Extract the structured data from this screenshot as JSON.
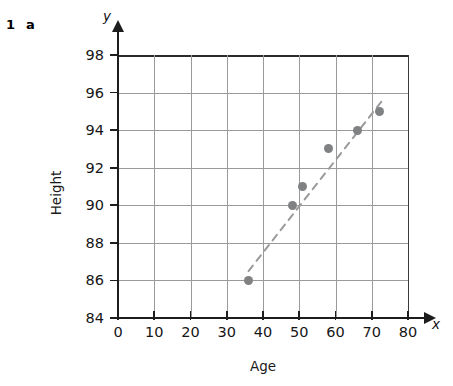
{
  "question": {
    "number": "1",
    "part": "a"
  },
  "chart_data": {
    "type": "scatter",
    "title": "",
    "xlabel": "Age",
    "ylabel": "Height",
    "x_axis_symbol": "x",
    "y_axis_symbol": "y",
    "xlim": [
      0,
      80
    ],
    "ylim": [
      84,
      98
    ],
    "xticks": [
      0,
      10,
      20,
      30,
      40,
      50,
      60,
      70,
      80
    ],
    "yticks": [
      84,
      86,
      88,
      90,
      92,
      94,
      96,
      98
    ],
    "xtick_labels": [
      "0",
      "10",
      "20",
      "30",
      "40",
      "50",
      "60",
      "70",
      "80"
    ],
    "ytick_labels": [
      "84",
      "86",
      "88",
      "90",
      "92",
      "94",
      "96",
      "98"
    ],
    "grid": true,
    "legend": null,
    "point_color": "#7f8183",
    "grid_color": "#9a9a9a",
    "axis_color": "#1d1d1d",
    "trendline_color": "#9a9a9a",
    "points": [
      {
        "x": 36,
        "y": 86
      },
      {
        "x": 48,
        "y": 90
      },
      {
        "x": 51,
        "y": 91
      },
      {
        "x": 58,
        "y": 93
      },
      {
        "x": 66,
        "y": 94
      },
      {
        "x": 72,
        "y": 95
      }
    ],
    "trendline": {
      "style": "dashed",
      "x1": 36,
      "y1": 86.5,
      "x2": 73,
      "y2": 95.6
    }
  }
}
